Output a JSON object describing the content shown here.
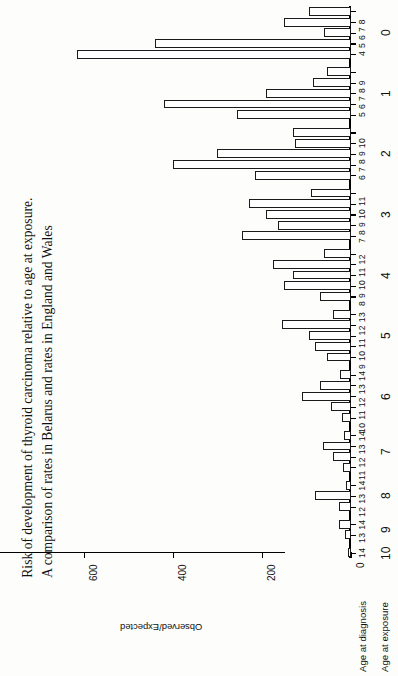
{
  "title": {
    "line1": "Risk of development of thyroid carcinoma relative to age at exposure.",
    "line2": "A comparison of rates in Belarus and rates in England and Wales"
  },
  "axes": {
    "value_label": "Observed/Expected",
    "diagnosis_caption": "Age at diagnosis",
    "exposure_caption": "Age at exposure",
    "value_ticks": [
      "0",
      "200",
      "400",
      "600"
    ],
    "value_tick_values": [
      0,
      200,
      400,
      600
    ],
    "value_max": 640
  },
  "chart_data": {
    "type": "bar",
    "orientation": "horizontal",
    "title": "Risk of development of thyroid carcinoma relative to age at exposure. A comparison of rates in Belarus and rates in England and Wales",
    "xlabel": "Observed/Expected",
    "ylabel": "Age at exposure / Age at diagnosis",
    "xlim": [
      0,
      640
    ],
    "grid": false,
    "legend": "none",
    "groups": [
      {
        "exposure_age": "0",
        "diagnosis_label": "4 5 6 7 8",
        "diagnosis_ages": [
          "4",
          "5",
          "6",
          "7",
          "8"
        ],
        "values": [
          95,
          150,
          60,
          440,
          615
        ]
      },
      {
        "exposure_age": "1",
        "diagnosis_label": "5 6 7 8 9",
        "diagnosis_ages": [
          "5",
          "6",
          "7",
          "8",
          "9"
        ],
        "values": [
          55,
          85,
          190,
          420,
          255
        ]
      },
      {
        "exposure_age": "2",
        "diagnosis_label": "6 7 8 9 10",
        "diagnosis_ages": [
          "6",
          "7",
          "8",
          "9",
          "10"
        ],
        "values": [
          130,
          125,
          300,
          400,
          215
        ]
      },
      {
        "exposure_age": "3",
        "diagnosis_label": "7 8 9 10 11",
        "diagnosis_ages": [
          "7",
          "8",
          "9",
          "10",
          "11"
        ],
        "values": [
          90,
          230,
          190,
          165,
          245
        ]
      },
      {
        "exposure_age": "4",
        "diagnosis_label": "8 9 10 11 12",
        "diagnosis_ages": [
          "8",
          "9",
          "10",
          "11",
          "12"
        ],
        "values": [
          60,
          175,
          130,
          150,
          70
        ]
      },
      {
        "exposure_age": "5",
        "diagnosis_label": "9 10 11 12 13",
        "diagnosis_ages": [
          "9",
          "10",
          "11",
          "12",
          "13"
        ],
        "values": [
          40,
          155,
          95,
          80,
          55
        ]
      },
      {
        "exposure_age": "6",
        "diagnosis_label": "10 11 12 13 14",
        "diagnosis_ages": [
          "10",
          "11",
          "12",
          "13",
          "14"
        ],
        "values": [
          25,
          70,
          110,
          45,
          20
        ]
      },
      {
        "exposure_age": "7",
        "diagnosis_label": "11 12 13 14",
        "diagnosis_ages": [
          "11",
          "12",
          "13",
          "14"
        ],
        "values": [
          15,
          62,
          40,
          18
        ]
      },
      {
        "exposure_age": "8",
        "diagnosis_label": "12 13 14",
        "diagnosis_ages": [
          "12",
          "13",
          "14"
        ],
        "values": [
          12,
          80,
          28
        ]
      },
      {
        "exposure_age": "9",
        "diagnosis_label": "13 14",
        "diagnosis_ages": [
          "13",
          "14"
        ],
        "values": [
          26,
          14
        ]
      },
      {
        "exposure_age": "10",
        "diagnosis_label": "14",
        "diagnosis_ages": [
          "14"
        ],
        "values": [
          6
        ]
      }
    ]
  }
}
